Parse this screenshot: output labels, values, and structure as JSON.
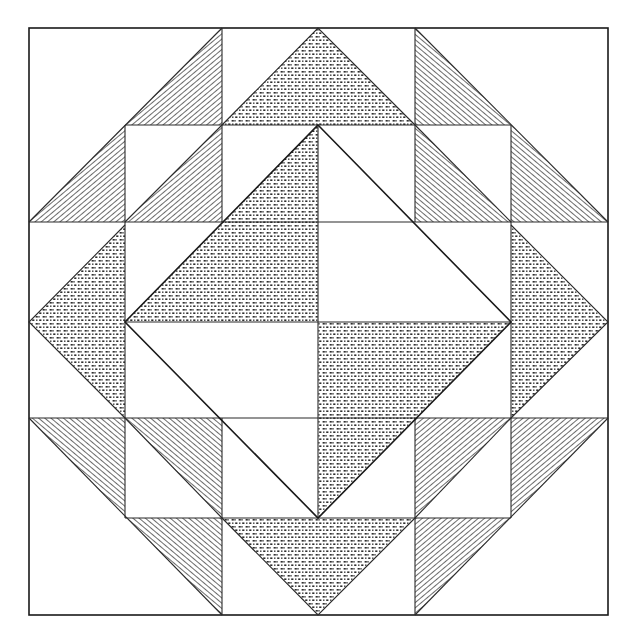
{
  "figure": {
    "kind": "line-art quilt block",
    "grid": {
      "cells": 6,
      "origin": [
        29,
        28
      ],
      "size": 579
    },
    "fills": {
      "hatch": {
        "name": "diagonal hatch",
        "color": "#3a3a3a"
      },
      "dots": {
        "name": "dotted print",
        "color": "#2e2e2e"
      },
      "plain": {
        "name": "white",
        "color": "#ffffff"
      }
    },
    "pieces": {
      "center_diamond": "four half-square triangles (dotted top-left & bottom-right, white top-right & bottom-left)",
      "side_triangles": "dotted triangles at top, bottom, left, right",
      "corners": "hatched flying-geese triangles in each corner region"
    }
  }
}
